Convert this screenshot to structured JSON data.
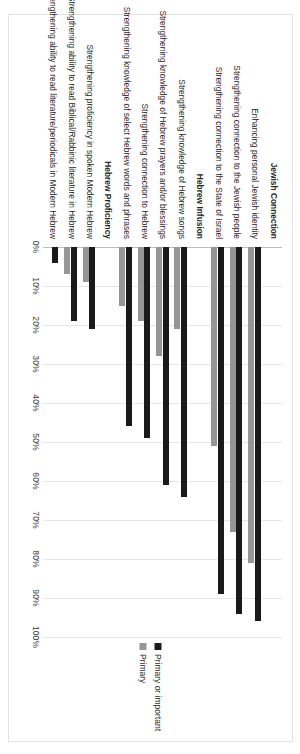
{
  "chart_data": {
    "type": "bar",
    "orientation": "horizontal",
    "title": "",
    "xlabel": "",
    "ylabel": "",
    "xlim": [
      0,
      100
    ],
    "xticks": [
      "0%",
      "10%",
      "20%",
      "30%",
      "40%",
      "50%",
      "60%",
      "70%",
      "80%",
      "90%",
      "100%"
    ],
    "xtick_values": [
      0,
      10,
      20,
      30,
      40,
      50,
      60,
      70,
      80,
      90,
      100
    ],
    "grid": true,
    "legend_position": "right",
    "series": [
      {
        "name": "Primary or important",
        "color": "#1a1a1a",
        "values": [
          null,
          96,
          94,
          89,
          null,
          64,
          61,
          49,
          46,
          null,
          21,
          19,
          4
        ]
      },
      {
        "name": "Primary",
        "color": "#969696",
        "values": [
          null,
          81,
          73,
          51,
          null,
          21,
          28,
          19,
          15,
          null,
          9,
          7,
          0
        ]
      }
    ],
    "categories": [
      "Jewish Connection",
      "Enhancing personal Jewish identity",
      "Strengthening connection to the Jewish people",
      "Strengthening connection to the State of Israel",
      "Hebrew Infusion",
      "Strengthening knowledge of Hebrew songs",
      "Strengthening knowledge of Hebrew prayers and/or blessings",
      "Strengthening connection to Hebrew",
      "Strengthening knowledge of select Hebrew words and phrases",
      "Hebrew Proficiency",
      "Strengthening proficiency in spoken Modern Hebrew",
      "Strengthening ability to read Biblical/Rabbinic literature in Hebrew",
      "Strengthening ability to read literature/periodicals in Modern Hebrew"
    ],
    "group_headers": [
      "Jewish Connection",
      "Hebrew Infusion",
      "Hebrew Proficiency"
    ]
  },
  "legend": {
    "items": [
      {
        "label": "Primary or important",
        "color": "#1a1a1a"
      },
      {
        "label": "Primary",
        "color": "#969696"
      }
    ]
  },
  "colors": {
    "primary_or_important": "#1a1a1a",
    "primary": "#969696",
    "gridline": "#e6e6e6",
    "frame": "#e3e3e3",
    "background": "#ffffff"
  }
}
